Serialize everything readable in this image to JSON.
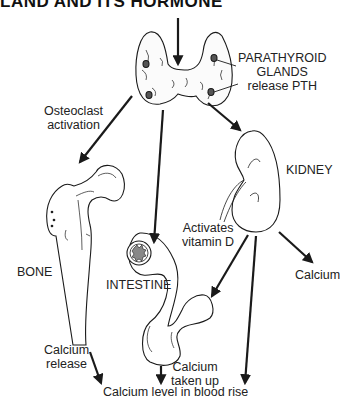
{
  "title": "LAND AND ITS HORMONE",
  "labels": {
    "parathyroid": [
      "PARATHYROID",
      "GLANDS",
      "release PTH"
    ],
    "osteoclast": [
      "Osteoclast",
      "activation"
    ],
    "kidney": "KIDNEY",
    "activates": [
      "Activates",
      "vitamin D"
    ],
    "calcium_kidney": "Calcium",
    "bone": "BONE",
    "intestine": "INTESTINE",
    "calcium_release": [
      "Calcium",
      "release"
    ],
    "calcium_taken_up": [
      "Calcium",
      "taken up"
    ],
    "blood_rise": "Calcium level in blood rise"
  },
  "organs": [
    "parathyroid-glands",
    "bone",
    "kidney",
    "intestine"
  ],
  "arrows": [
    {
      "from": "top",
      "to": "parathyroid-glands"
    },
    {
      "from": "parathyroid-glands",
      "to": "bone",
      "label": "Osteoclast activation"
    },
    {
      "from": "parathyroid-glands",
      "to": "intestine"
    },
    {
      "from": "parathyroid-glands",
      "to": "kidney"
    },
    {
      "from": "kidney",
      "to": "intestine",
      "label": "Activates vitamin D"
    },
    {
      "from": "kidney",
      "to": "calcium",
      "label": "Calcium"
    },
    {
      "from": "kidney",
      "to": "blood"
    },
    {
      "from": "bone",
      "to": "blood",
      "label": "Calcium release"
    },
    {
      "from": "intestine",
      "to": "blood",
      "label": "Calcium taken up"
    }
  ],
  "colors": {
    "stroke": "#1a1a1a",
    "background": "#ffffff"
  }
}
